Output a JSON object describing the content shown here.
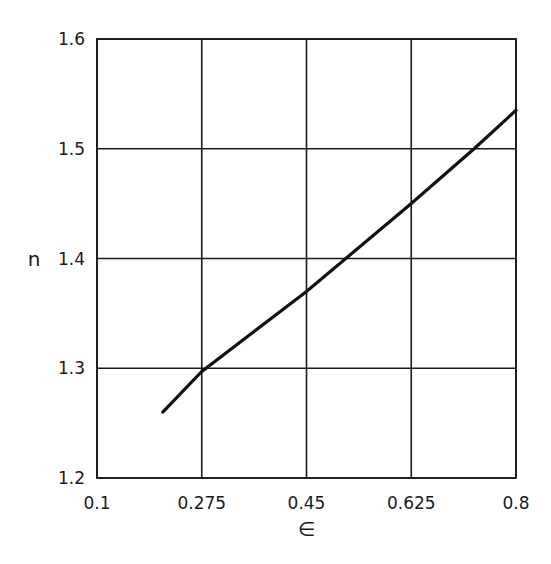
{
  "chart_data": {
    "type": "line",
    "title": "",
    "xlabel": "∈",
    "ylabel": "n",
    "xlim": [
      0.1,
      0.8
    ],
    "ylim": [
      1.2,
      1.6
    ],
    "x_ticks": [
      0.1,
      0.275,
      0.45,
      0.625,
      0.8
    ],
    "x_tick_labels": [
      "0.1",
      "0.275",
      "0.45",
      "0.625",
      "0.8"
    ],
    "y_ticks": [
      1.2,
      1.3,
      1.4,
      1.5,
      1.6
    ],
    "y_tick_labels": [
      "1.2",
      "1.3",
      "1.4",
      "1.5",
      "1.6"
    ],
    "grid": true,
    "legend": null,
    "series": [
      {
        "name": "n vs ∈",
        "color": "#111111",
        "x": [
          0.21,
          0.275,
          0.45,
          0.625,
          0.73,
          0.8
        ],
        "y": [
          1.26,
          1.297,
          1.37,
          1.45,
          1.5,
          1.535
        ]
      }
    ]
  },
  "layout": {
    "plot_left": 97,
    "plot_right": 516,
    "plot_top": 39,
    "plot_bottom": 478
  }
}
